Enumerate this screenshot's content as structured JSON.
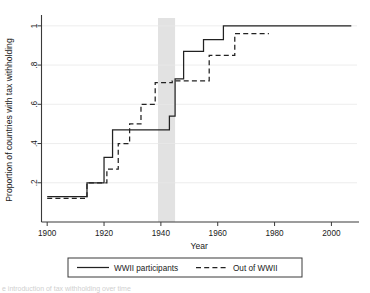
{
  "chart_data": {
    "type": "line",
    "title": "",
    "xlabel": "Year",
    "ylabel": "Proportion of countries with tax withholding",
    "xlim": [
      1898,
      2009
    ],
    "ylim": [
      0,
      1.04
    ],
    "grid": true,
    "legend_position": "bottom-center",
    "xticks": [
      1900,
      1920,
      1940,
      1960,
      1980,
      2000
    ],
    "xtick_labels": [
      "1900",
      "1920",
      "1940",
      "1960",
      "1980",
      "2000"
    ],
    "yticks": [
      0.2,
      0.4,
      0.6,
      0.8,
      1
    ],
    "ytick_labels": [
      ".2",
      ".4",
      ".6",
      ".8",
      "1"
    ],
    "annotations": [
      {
        "name": "wwii-shaded-band",
        "type": "vspan",
        "x_start": 1939,
        "x_end": 1945,
        "color": "#e2e2e2",
        "label": ""
      }
    ],
    "series": [
      {
        "name": "WWII participants",
        "style": "solid",
        "color": "#222222",
        "step": "post",
        "x": [
          1900,
          1913,
          1914,
          1919,
          1920,
          1922,
          1923,
          1939,
          1940,
          1942,
          1943,
          1944,
          1945,
          1947,
          1948,
          1954,
          1955,
          1961,
          1962,
          2007
        ],
        "y": [
          0.13,
          0.13,
          0.2,
          0.2,
          0.33,
          0.33,
          0.47,
          0.47,
          0.47,
          0.47,
          0.54,
          0.54,
          0.73,
          0.73,
          0.87,
          0.87,
          0.93,
          0.93,
          1.0,
          1.0
        ]
      },
      {
        "name": "Out of WWII",
        "style": "dashed",
        "color": "#222222",
        "step": "post",
        "x": [
          1900,
          1913,
          1914,
          1920,
          1921,
          1924,
          1925,
          1928,
          1929,
          1932,
          1933,
          1937,
          1938,
          1943,
          1944,
          1949,
          1950,
          1956,
          1957,
          1965,
          1966,
          1978
        ],
        "y": [
          0.12,
          0.12,
          0.2,
          0.2,
          0.27,
          0.27,
          0.4,
          0.4,
          0.5,
          0.5,
          0.6,
          0.6,
          0.71,
          0.71,
          0.72,
          0.72,
          0.72,
          0.72,
          0.85,
          0.85,
          0.96,
          0.96
        ]
      }
    ]
  },
  "legend": {
    "items": [
      {
        "label": "WWII participants",
        "style": "solid"
      },
      {
        "label": "Out of WWII",
        "style": "dashed"
      }
    ]
  },
  "caption": {
    "text": "e introduction of tax withholding over time"
  }
}
